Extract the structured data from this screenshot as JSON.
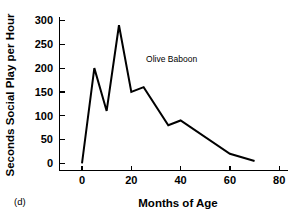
{
  "panel": {
    "label": "(d)"
  },
  "chart_data": {
    "type": "line",
    "title": "",
    "subtitle": "",
    "xlabel": "Months of Age",
    "ylabel": "Seconds Social Play per Hour",
    "xlim": [
      -5,
      85
    ],
    "ylim": [
      0,
      315
    ],
    "xticks": [
      0,
      20,
      40,
      60,
      80
    ],
    "xtick_labels": [
      "0",
      "20",
      "40",
      "60",
      "80"
    ],
    "yticks": [
      0,
      50,
      100,
      150,
      200,
      250,
      300
    ],
    "ytick_labels": [
      "0",
      "50",
      "100",
      "150",
      "200",
      "250",
      "300"
    ],
    "grid": false,
    "legend": "none",
    "line_color": "#000000",
    "series": [
      {
        "name": "Olive Baboon",
        "x": [
          0,
          5,
          10,
          15,
          20,
          25,
          35,
          40,
          60,
          70
        ],
        "y": [
          0,
          200,
          110,
          290,
          150,
          160,
          80,
          90,
          20,
          5
        ]
      }
    ],
    "annotations": [
      {
        "text": "Olive Baboon",
        "x": 26,
        "y": 212
      }
    ]
  }
}
